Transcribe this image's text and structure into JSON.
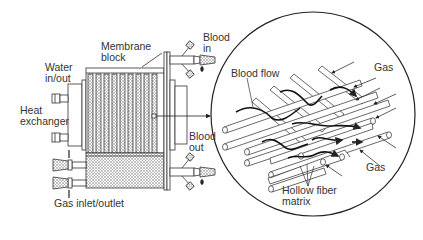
{
  "diagram": {
    "labels": {
      "membrane_block_1": "Membrane",
      "membrane_block_2": "block",
      "water_1": "Water",
      "water_2": "in/out",
      "heat_1": "Heat",
      "heat_2": "exchanger",
      "blood_in_1": "Blood",
      "blood_in_2": "in",
      "blood_out_1": "Blood",
      "blood_out_2": "out",
      "gas_inlet_outlet": "Gas inlet/outlet",
      "blood_flow": "Blood flow",
      "gas_top": "Gas",
      "gas_bottom": "Gas",
      "hollow_fiber_1": "Hollow fiber",
      "hollow_fiber_2": "matrix"
    },
    "components": [
      "Membrane block",
      "Heat exchanger",
      "Water in/out ports",
      "Blood in port",
      "Blood out port",
      "Gas inlet/outlet ports",
      "Magnified hollow fiber matrix"
    ],
    "colors": {
      "line": "#222222",
      "hatch": "#888888",
      "background": "#ffffff"
    }
  }
}
